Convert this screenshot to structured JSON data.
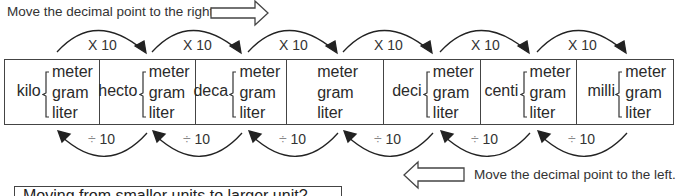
{
  "instructions": {
    "right": "Move the decimal point to the right.",
    "left": "Move the decimal point to the left."
  },
  "units": [
    "meter",
    "gram",
    "liter"
  ],
  "cells": [
    {
      "prefix": "kilo",
      "left": 0,
      "width": 95
    },
    {
      "prefix": "hecto",
      "left": 95,
      "width": 97
    },
    {
      "prefix": "deca",
      "left": 192,
      "width": 91
    },
    {
      "prefix": "",
      "left": 283,
      "width": 97
    },
    {
      "prefix": "deci",
      "left": 380,
      "width": 97
    },
    {
      "prefix": "centi",
      "left": 477,
      "width": 97
    },
    {
      "prefix": "milli",
      "left": 574,
      "width": 96
    }
  ],
  "multiply_label": "X 10",
  "divide_symbol": "÷",
  "divide_value": "10",
  "question_box": "Moving from smaller units to larger unit?",
  "colors": {
    "line": "#444444",
    "text": "#2a2a2a",
    "arrow": "#222222"
  }
}
